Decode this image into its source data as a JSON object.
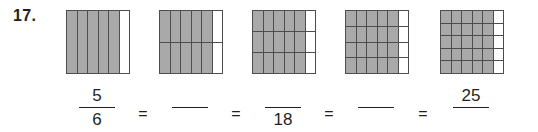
{
  "problem": {
    "number_label": "17.",
    "equals_sign": "=",
    "shade_color": "#a9a9a9",
    "line_color": "#4d4d4d",
    "text_color": "#231f20"
  },
  "figures": [
    {
      "name": "figure-sixths",
      "columns": 6,
      "rows": 1,
      "shaded_columns": 5,
      "total_cells": 6,
      "shaded_cells": 5,
      "left": 66
    },
    {
      "name": "figure-twelfths",
      "columns": 6,
      "rows": 2,
      "shaded_columns": 5,
      "total_cells": 12,
      "shaded_cells": 10,
      "left": 159
    },
    {
      "name": "figure-eighteenths",
      "columns": 6,
      "rows": 3,
      "shaded_columns": 5,
      "total_cells": 18,
      "shaded_cells": 15,
      "left": 252
    },
    {
      "name": "figure-twentyfourths",
      "columns": 6,
      "rows": 4,
      "shaded_columns": 5,
      "total_cells": 24,
      "shaded_cells": 20,
      "left": 345
    },
    {
      "name": "figure-thirtieths",
      "columns": 6,
      "rows": 5,
      "shaded_columns": 5,
      "total_cells": 30,
      "shaded_cells": 25,
      "left": 440
    }
  ],
  "equation": {
    "fractions": [
      {
        "name": "fraction-1",
        "numerator": "5",
        "denominator": "6",
        "left": 76
      },
      {
        "name": "fraction-2",
        "numerator": "",
        "denominator": "",
        "left": 169
      },
      {
        "name": "fraction-3",
        "numerator": "",
        "denominator": "18",
        "left": 262
      },
      {
        "name": "fraction-4",
        "numerator": "",
        "denominator": "",
        "left": 355
      },
      {
        "name": "fraction-5",
        "numerator": "25",
        "denominator": "",
        "left": 450
      }
    ],
    "operators": [
      {
        "name": "equals-1",
        "symbol": "=",
        "left": 134
      },
      {
        "name": "equals-2",
        "symbol": "=",
        "left": 227
      },
      {
        "name": "equals-3",
        "symbol": "=",
        "left": 320
      },
      {
        "name": "equals-4",
        "symbol": "=",
        "left": 414
      }
    ]
  }
}
